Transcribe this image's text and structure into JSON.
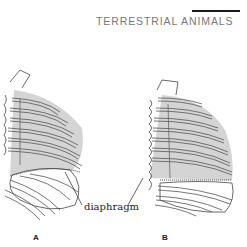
{
  "header": {
    "title": "TERRESTRIAL ANIMALS"
  },
  "figure": {
    "label": "diaphragm",
    "panels": [
      {
        "id": "A"
      },
      {
        "id": "B"
      }
    ],
    "colors": {
      "shading": "#d4d4d4",
      "line": "#333333",
      "title": "#777777"
    }
  }
}
